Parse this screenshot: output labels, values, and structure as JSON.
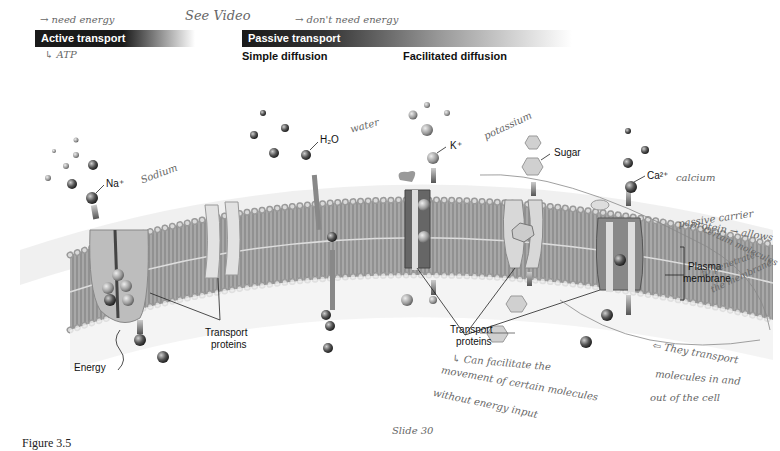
{
  "headers": {
    "active_transport": "Active transport",
    "passive_transport": "Passive transport",
    "simple_diffusion": "Simple diffusion",
    "facilitated_diffusion": "Facilitated diffusion"
  },
  "labels": {
    "sodium": "Na⁺",
    "water": "H₂O",
    "potassium": "K⁺",
    "sugar": "Sugar",
    "calcium": "Ca²⁺",
    "plasma_membrane_1": "Plasma",
    "plasma_membrane_2": "membrane",
    "transport_proteins_left_1": "Transport",
    "transport_proteins_left_2": "proteins",
    "transport_proteins_mid_1": "Transport",
    "transport_proteins_mid_2": "proteins",
    "energy": "Energy"
  },
  "caption": "Figure 3.5",
  "handwritten_notes": {
    "see_video": "See Video",
    "active_note": "→ need energy",
    "atp_note": "↳ ATP",
    "passive_note": "→ don't need energy",
    "sodium_note": "Sodium",
    "water_note": "water",
    "potassium_note": "potassium",
    "calcium_note": "calcium",
    "passive_carrier_1": "passive carrier",
    "passive_carrier_2": "protein → allows",
    "passive_carrier_3": "certain molecules",
    "passive_carrier_4": "to penetrate",
    "passive_carrier_5": "the membrane",
    "they_transport_1": "⇦ They transport",
    "they_transport_2": "molecules in and",
    "they_transport_3": "out of the cell",
    "facilitate_1": "↳ Can facilitate the",
    "facilitate_2": "movement of certain molecules",
    "facilitate_3": "without energy input",
    "slide": "Slide 30"
  },
  "colors": {
    "header_bar": "#1a1a1a",
    "membrane_fill": "#9a9a9a",
    "head_bead": "#b8b8b8",
    "protein": "#d8d8d8",
    "channel_dark": "#555555"
  }
}
